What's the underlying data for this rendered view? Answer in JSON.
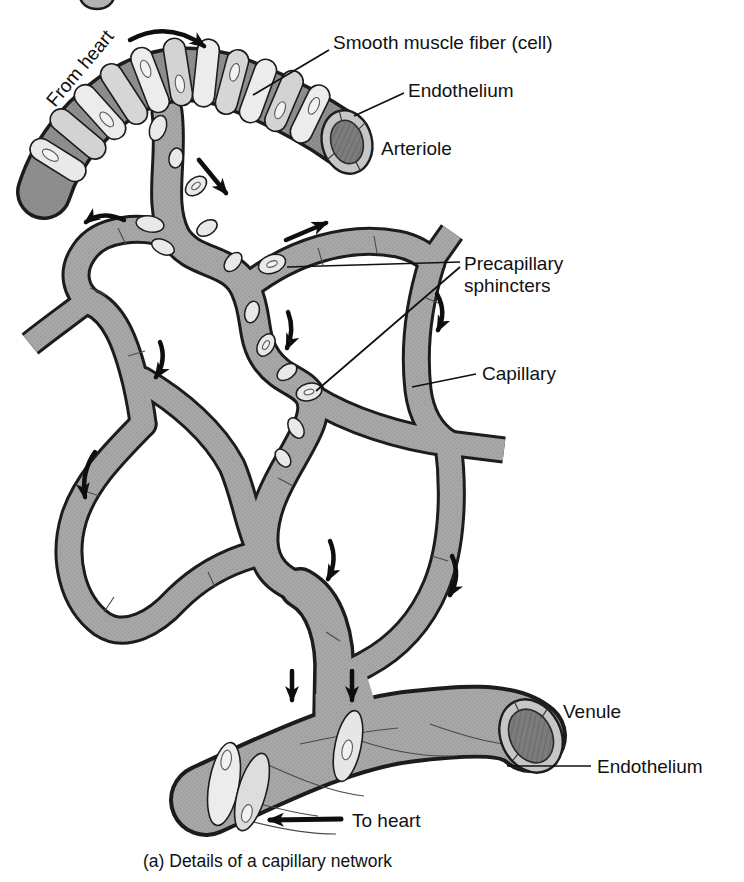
{
  "figure": {
    "caption": "(a) Details of a capillary network"
  },
  "labels": {
    "from_heart": "From heart",
    "smooth_muscle": "Smooth muscle fiber (cell)",
    "endothelium_top": "Endothelium",
    "arteriole": "Arteriole",
    "precapillary_line1": "Precapillary",
    "precapillary_line2": "sphincters",
    "capillary": "Capillary",
    "venule": "Venule",
    "endothelium_bottom": "Endothelium",
    "to_heart": "To heart"
  },
  "colors": {
    "background": "#ffffff",
    "vessel_fill": "#a7a7a7",
    "arteriole_wall_fill": "#8f8f8f",
    "vessel_outline": "#1c1c1c",
    "muscle_cell_fill": "#e9e9e9",
    "cut_ring_fill": "#c6c6c6",
    "lumen_fill": "#7a7a7a",
    "text": "#111111",
    "arrow": "#0e0e0e"
  }
}
